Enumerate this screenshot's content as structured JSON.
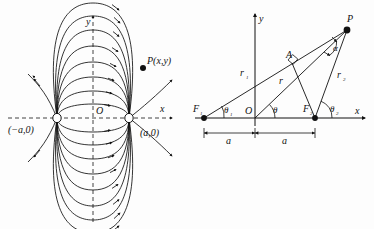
{
  "figure": {
    "type": "diagram",
    "background_color": "#fdfdfd",
    "ink_color": "#111111"
  },
  "left_panel": {
    "name": "dipole-field-diagram",
    "axis_x_label": "x",
    "axis_y_label": "y",
    "origin_label": "O",
    "charge_left_label": "(−a,0)",
    "charge_right_label": "(a,0)",
    "point_label": "P(x,y)",
    "charge_left_x": -1,
    "charge_right_x": 1,
    "field_arc_count": 8,
    "radial_line_count": 4,
    "axis_style": "dashed"
  },
  "right_panel": {
    "name": "geometry-construction-diagram",
    "axis_x_label": "x",
    "axis_y_label": "y",
    "origin_label": "O",
    "focus_left_label": "F",
    "focus_left_sub": "1",
    "focus_right_label": "F",
    "focus_right_sub": "2",
    "point_label": "P",
    "foot_label": "A",
    "r1_label": "r",
    "r1_sub": "1",
    "r_label": "r",
    "r2_label": "r",
    "r2_sub": "2",
    "theta1_label": "θ",
    "theta1_sub": "1",
    "theta_label": "θ",
    "theta2_label": "θ",
    "theta2_sub": "2",
    "alpha_label": "α",
    "dim_left_label": "a",
    "dim_right_label": "a",
    "right_angle_marker": true
  }
}
